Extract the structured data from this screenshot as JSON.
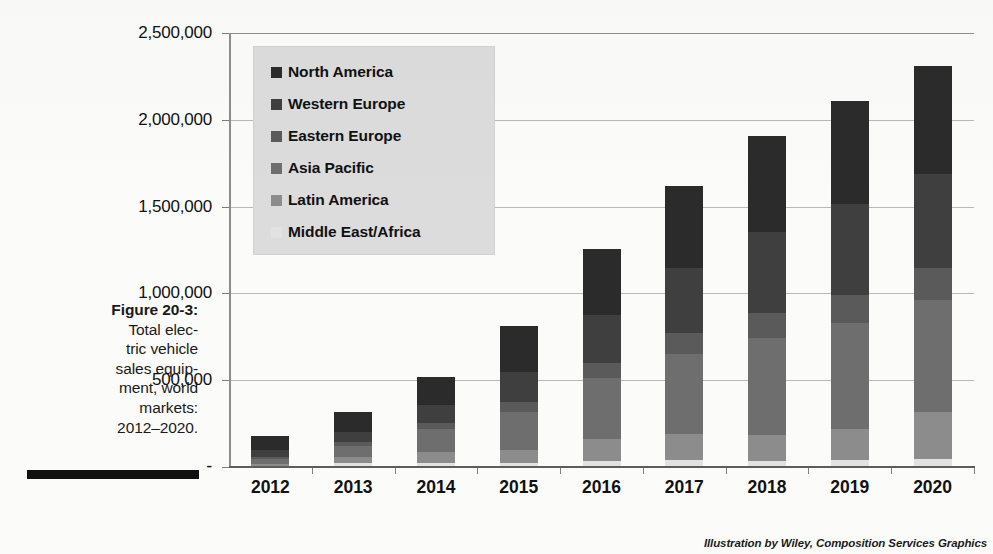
{
  "figure": {
    "number_label": "Figure 20-3:",
    "caption_lines": [
      "Total elec-",
      "tric vehicle",
      "sales equip-",
      "ment, world",
      "markets:",
      "2012–2020."
    ]
  },
  "credit": "Illustration by Wiley, Composition Services Graphics",
  "colors": {
    "north_america": "#2b2b2b",
    "western_europe": "#3f3f3f",
    "eastern_europe": "#5a5a5a",
    "asia_pacific": "#6e6e6e",
    "latin_america": "#8c8c8c",
    "middle_east_africa": "#e2e2e2",
    "legend_background": "#dcdcdc",
    "gridline": "#b9b9b9",
    "axis": "#7d7d7d",
    "text": "#111111"
  },
  "chart_data": {
    "type": "bar",
    "subtype": "stacked-column",
    "title": "",
    "xlabel": "",
    "ylabel": "",
    "ylim": [
      0,
      2500000
    ],
    "grid": true,
    "legend_position": "inside-top-left",
    "y_ticks": [
      {
        "value": 2500000,
        "label": "2,500,000"
      },
      {
        "value": 2000000,
        "label": "2,000,000"
      },
      {
        "value": 1500000,
        "label": "1,500,000"
      },
      {
        "value": 1000000,
        "label": "1,000,000"
      },
      {
        "value": 500000,
        "label": "500,000"
      },
      {
        "value": 0,
        "label": "-"
      }
    ],
    "categories": [
      "2012",
      "2013",
      "2014",
      "2015",
      "2016",
      "2017",
      "2018",
      "2019",
      "2020"
    ],
    "series": [
      {
        "name": "North America",
        "color": "#2b2b2b",
        "values": [
          80000,
          115000,
          160000,
          265000,
          380000,
          470000,
          550000,
          595000,
          620000
        ]
      },
      {
        "name": "Western Europe",
        "color": "#3f3f3f",
        "values": [
          40000,
          60000,
          105000,
          170000,
          275000,
          375000,
          470000,
          520000,
          545000
        ]
      },
      {
        "name": "Eastern Europe",
        "color": "#5a5a5a",
        "values": [
          10000,
          18000,
          35000,
          60000,
          90000,
          120000,
          145000,
          165000,
          180000
        ]
      },
      {
        "name": "Asia Pacific",
        "color": "#6e6e6e",
        "values": [
          33000,
          68000,
          133000,
          216000,
          350000,
          465000,
          555000,
          610000,
          650000
        ]
      },
      {
        "name": "Latin America",
        "color": "#8c8c8c",
        "values": [
          8000,
          35000,
          65000,
          80000,
          125000,
          150000,
          150000,
          175000,
          270000
        ]
      },
      {
        "name": "Middle East/Africa",
        "color": "#e2e2e2",
        "values": [
          2000,
          15000,
          15000,
          15000,
          30000,
          33000,
          30000,
          37000,
          39000
        ]
      }
    ],
    "totals": [
      173000,
      311000,
      513000,
      806000,
      1250000,
      1613000,
      1900000,
      2102000,
      2304000
    ]
  }
}
